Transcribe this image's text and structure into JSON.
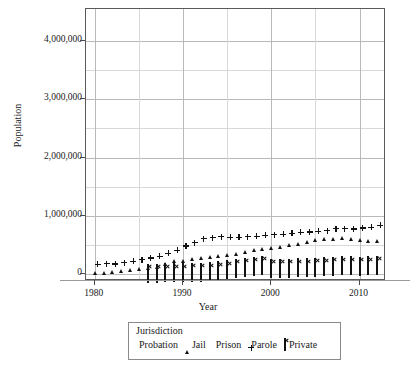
{
  "chart_data": {
    "type": "scatter",
    "title": "",
    "xlabel": "Year",
    "ylabel": "Population",
    "xlim": [
      1979,
      2013
    ],
    "ylim": [
      -120000,
      4550000
    ],
    "xticks": [
      1980,
      1990,
      2000,
      2010
    ],
    "xtick_labels": [
      "1980",
      "1990",
      "2000",
      "2010"
    ],
    "yticks": [
      0,
      1000000,
      2000000,
      3000000,
      4000000
    ],
    "ytick_labels": [
      "0",
      "1,000,000",
      "2,000,000",
      "3,000,000",
      "4,000,000"
    ],
    "y_minor_ticks": [
      500000,
      1500000,
      2500000,
      3500000
    ],
    "grid": true,
    "legend_position": "below-axes",
    "legend_title": "Jurisdiction",
    "series": [
      {
        "name": "Probation",
        "marker": "dot",
        "color": "#111111",
        "x": [
          1980,
          1981,
          1982,
          1983,
          1984,
          1985,
          1986,
          1987,
          1988,
          1989,
          1990,
          1991,
          1992,
          1993,
          1994,
          1995,
          1996,
          1997,
          1998,
          1999,
          2000,
          2001,
          2002,
          2003,
          2004,
          2005,
          2006,
          2007,
          2008,
          2009,
          2010,
          2011
        ],
        "values": [
          1118097,
          1225934,
          1357264,
          1582947,
          1740948,
          1968712,
          2114621,
          2247158,
          2356483,
          2522125,
          2670234,
          2728472,
          2811611,
          2903061,
          2981022,
          3077861,
          3164996,
          3296513,
          3670441,
          3779922,
          3826209,
          3931731,
          4024067,
          4120012,
          4143792,
          4162536,
          4236800,
          4293163,
          4270917,
          4203967,
          4055514,
          4055514
        ],
        "label_y_at_peak": 4293163
      },
      {
        "name": "Jail",
        "marker": "triangle",
        "color": "#111111",
        "x": [
          1980,
          1981,
          1982,
          1983,
          1984,
          1985,
          1986,
          1987,
          1988,
          1989,
          1990,
          1991,
          1992,
          1993,
          1994,
          1995,
          1996,
          1997,
          1998,
          1999,
          2000,
          2001,
          2002,
          2003,
          2004,
          2005,
          2006,
          2007,
          2008,
          2009,
          2010,
          2011,
          2012
        ],
        "values": [
          182288,
          195085,
          209582,
          223551,
          234500,
          254986,
          272736,
          294092,
          341893,
          393303,
          403019,
          424129,
          441781,
          455500,
          479800,
          499300,
          510400,
          557974,
          592462,
          605943,
          621149,
          631240,
          665475,
          691301,
          713990,
          747529,
          765819,
          780174,
          785533,
          767434,
          748728,
          735601,
          744524
        ]
      },
      {
        "name": "Prison",
        "marker": "square",
        "color": "#111111",
        "x": [
          1980,
          1981,
          1982,
          1983,
          1984,
          1985,
          1986,
          1987,
          1988,
          1989,
          1990,
          1991,
          1992,
          1993,
          1994,
          1995,
          1996,
          1997,
          1998,
          1999,
          2000,
          2001,
          2002,
          2003,
          2004,
          2005,
          2006,
          2007,
          2008,
          2009,
          2010,
          2011,
          2012
        ],
        "values": [
          319598,
          360029,
          402914,
          423898,
          448264,
          487593,
          526436,
          562814,
          607766,
          683367,
          743382,
          792535,
          850566,
          909381,
          990147,
          1078542,
          1127528,
          1176564,
          1224469,
          1287172,
          1331278,
          1345217,
          1380516,
          1390279,
          1421345,
          1462866,
          1504598,
          1532851,
          1547742,
          1555600,
          1552669,
          1538847,
          1512400
        ]
      },
      {
        "name": "Parole",
        "marker": "plus",
        "color": "#111111",
        "x": [
          1980,
          1981,
          1982,
          1983,
          1984,
          1985,
          1986,
          1987,
          1988,
          1989,
          1990,
          1991,
          1992,
          1993,
          1994,
          1995,
          1996,
          1997,
          1998,
          1999,
          2000,
          2001,
          2002,
          2003,
          2004,
          2005,
          2006,
          2007,
          2008,
          2009,
          2010,
          2011,
          2012
        ],
        "values": [
          220438,
          225539,
          224604,
          246440,
          266992,
          300203,
          325638,
          355505,
          407977,
          456803,
          531407,
          590442,
          658601,
          676100,
          690371,
          679421,
          679733,
          694787,
          696385,
          714457,
          723898,
          732333,
          750934,
          769925,
          771852,
          784408,
          798202,
          826097,
          828169,
          824365,
          840676,
          853852,
          886900
        ]
      },
      {
        "name": "Private",
        "marker": "boxed-x",
        "color": "#111111",
        "x": [
          1986,
          1987,
          1988,
          1989,
          1990,
          1991,
          1992,
          1993,
          1994,
          1995,
          1996,
          1997,
          1998,
          1999,
          2000,
          2001,
          2002,
          2003,
          2004,
          2005,
          2006,
          2007,
          2008,
          2009,
          2010,
          2011,
          2012
        ],
        "values": [
          3000,
          3100,
          15300,
          10970,
          15060,
          20687,
          20348,
          28540,
          49154,
          65957,
          85201,
          106940,
          122600,
          145170,
          87369,
          91953,
          93912,
          95522,
          98628,
          107940,
          113791,
          126222,
          129336,
          129336,
          128195,
          130941,
          137220
        ]
      }
    ]
  },
  "axes": {
    "x_title": "Year",
    "y_title": "Population"
  },
  "legend": {
    "title": "Jurisdiction",
    "entries": [
      {
        "label": "Probation",
        "marker": "dot"
      },
      {
        "label": "Jail",
        "marker": "triangle"
      },
      {
        "label": "Prison",
        "marker": "square"
      },
      {
        "label": "Parole",
        "marker": "plus"
      },
      {
        "label": "Private",
        "marker": "boxed-x"
      }
    ]
  }
}
